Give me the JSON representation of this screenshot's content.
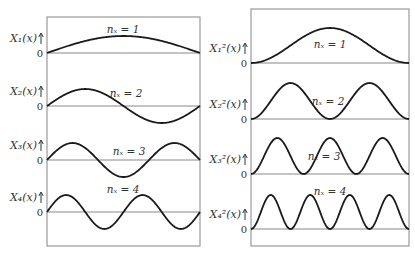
{
  "figure": {
    "left_panel": {
      "title": "Wavefunctions",
      "box": {
        "x": 47,
        "y": 17,
        "w": 153,
        "h": 229
      },
      "rows": [
        {
          "label": "X₁(x)",
          "zero": "0",
          "n_label": "nₓ = 1",
          "n": 1,
          "baseline": 53,
          "amp": 17,
          "squared": false
        },
        {
          "label": "X₂(x)",
          "zero": "0",
          "n_label": "nₓ = 2",
          "n": 2,
          "baseline": 106,
          "amp": 17,
          "squared": false
        },
        {
          "label": "X₃(x)",
          "zero": "0",
          "n_label": "nₓ = 3",
          "n": 3,
          "baseline": 160,
          "amp": 17,
          "squared": false
        },
        {
          "label": "X₄(x)",
          "zero": "0",
          "n_label": "nₓ = 4",
          "n": 4,
          "baseline": 212,
          "amp": 17,
          "squared": false
        }
      ]
    },
    "right_panel": {
      "title": "Probability densities",
      "box": {
        "x": 251,
        "y": 9,
        "w": 158,
        "h": 237
      },
      "rows": [
        {
          "label": "X₁²(x)",
          "zero": "0",
          "n_label": "nₓ = 1",
          "n": 1,
          "baseline": 63,
          "amp": 35,
          "squared": true
        },
        {
          "label": "X₂²(x)",
          "zero": "0",
          "n_label": "nₓ = 2",
          "n": 2,
          "baseline": 119,
          "amp": 36,
          "squared": true
        },
        {
          "label": "X₃²(x)",
          "zero": "0",
          "n_label": "nₓ = 3",
          "n": 3,
          "baseline": 174,
          "amp": 36,
          "squared": true
        },
        {
          "label": "X₄²(x)",
          "zero": "0",
          "n_label": "nₓ = 4",
          "n": 4,
          "baseline": 229,
          "amp": 34,
          "squared": true
        }
      ]
    },
    "colors": {
      "curve": "#1a1a1a",
      "axis": "#888888",
      "frame": "#999999",
      "text": "#333333"
    }
  }
}
